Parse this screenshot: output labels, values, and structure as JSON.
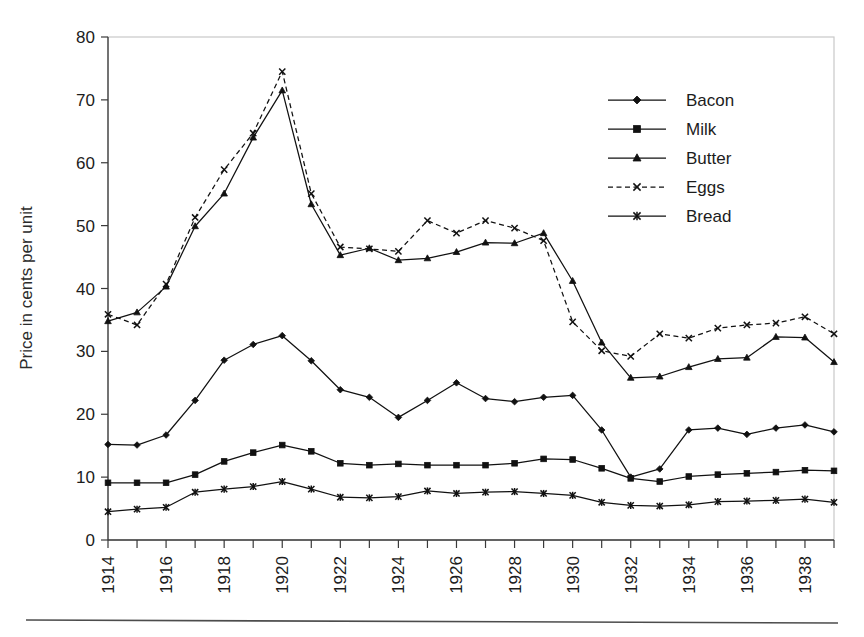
{
  "chart_data": {
    "type": "line",
    "title": "",
    "xlabel": "",
    "ylabel": "Price in cents per unit",
    "ylim": [
      0,
      80
    ],
    "ytick_step": 10,
    "yticks": [
      0,
      10,
      20,
      30,
      40,
      50,
      60,
      70,
      80
    ],
    "xlim": [
      1914,
      1939
    ],
    "x": [
      1914,
      1915,
      1916,
      1917,
      1918,
      1919,
      1920,
      1921,
      1922,
      1923,
      1924,
      1925,
      1926,
      1927,
      1928,
      1929,
      1930,
      1931,
      1932,
      1933,
      1934,
      1935,
      1936,
      1937,
      1938,
      1939
    ],
    "xtick_labels": [
      "1914",
      "",
      "1916",
      "",
      "1918",
      "",
      "1920",
      "",
      "1922",
      "",
      "1924",
      "",
      "1926",
      "",
      "1928",
      "",
      "1930",
      "",
      "1932",
      "",
      "1934",
      "",
      "1936",
      "",
      "1938",
      ""
    ],
    "grid": false,
    "legend_position": "upper-right",
    "series": [
      {
        "name": "Bacon",
        "marker": "diamond",
        "dash": false,
        "values": [
          15.2,
          15.1,
          16.7,
          22.2,
          28.6,
          31.1,
          32.5,
          28.5,
          23.9,
          22.7,
          19.5,
          22.2,
          25.0,
          22.5,
          22.0,
          22.7,
          23.0,
          17.5,
          10.0,
          11.3,
          17.5,
          17.8,
          16.8,
          17.8,
          18.3,
          17.2
        ]
      },
      {
        "name": "Milk",
        "marker": "square",
        "dash": false,
        "values": [
          9.1,
          9.1,
          9.1,
          10.4,
          12.5,
          13.9,
          15.1,
          14.1,
          12.2,
          11.9,
          12.1,
          11.9,
          11.9,
          11.9,
          12.2,
          12.9,
          12.8,
          11.4,
          9.8,
          9.3,
          10.1,
          10.4,
          10.6,
          10.8,
          11.1,
          11.0
        ]
      },
      {
        "name": "Butter",
        "marker": "triangle",
        "dash": false,
        "values": [
          34.8,
          36.2,
          40.3,
          49.9,
          55.1,
          64.0,
          71.5,
          53.4,
          45.3,
          46.4,
          44.5,
          44.8,
          45.8,
          47.3,
          47.2,
          48.8,
          41.2,
          31.4,
          25.8,
          26.0,
          27.5,
          28.8,
          29.0,
          32.3,
          32.2,
          28.3
        ]
      },
      {
        "name": "Eggs",
        "marker": "x",
        "dash": true,
        "values": [
          35.9,
          34.2,
          40.7,
          51.3,
          58.9,
          64.7,
          74.5,
          55.1,
          46.6,
          46.3,
          45.9,
          50.8,
          48.8,
          50.8,
          49.6,
          47.6,
          34.7,
          30.1,
          29.2,
          32.8,
          32.1,
          33.7,
          34.2,
          34.5,
          35.5,
          32.8
        ]
      },
      {
        "name": "Bread",
        "marker": "asterisk",
        "dash": false,
        "values": [
          4.5,
          4.9,
          5.2,
          7.6,
          8.1,
          8.5,
          9.3,
          8.1,
          6.8,
          6.7,
          6.9,
          7.8,
          7.4,
          7.6,
          7.7,
          7.4,
          7.1,
          6.0,
          5.5,
          5.4,
          5.6,
          6.1,
          6.2,
          6.3,
          6.5,
          6.0
        ]
      }
    ],
    "legend_entries": [
      "Bacon",
      "Milk",
      "Butter",
      "Eggs",
      "Bread"
    ],
    "colors": {
      "series_stroke": "#111111",
      "frame": "#c9c9c9",
      "axis": "#3a3a3a",
      "text": "#1c1c1c",
      "background": "#ffffff"
    }
  }
}
